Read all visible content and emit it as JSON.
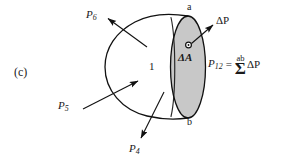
{
  "figure": {
    "panel_label": "(c)",
    "body_region_label": "1",
    "area_element_label": "ΔA",
    "endpoint_top_label": "a",
    "endpoint_bottom_label": "b",
    "colors": {
      "stroke": "#111111",
      "area_fill": "#c8c8c8",
      "background": "#ffffff"
    }
  },
  "vectors": [
    {
      "name": "p6",
      "label": "P",
      "subscript": "6",
      "direction": "up-left"
    },
    {
      "name": "p5",
      "label": "P",
      "subscript": "5",
      "direction": "up-right"
    },
    {
      "name": "p4",
      "label": "P",
      "subscript": "4",
      "direction": "down-left"
    },
    {
      "name": "dp",
      "label": "ΔP",
      "subscript": "",
      "direction": "up-right"
    }
  ],
  "equation": {
    "lhs": "P",
    "lhs_subscript": "12",
    "equals": "=",
    "sum_limit": "ab",
    "sum_sign": "Σ",
    "rhs": "ΔP"
  }
}
